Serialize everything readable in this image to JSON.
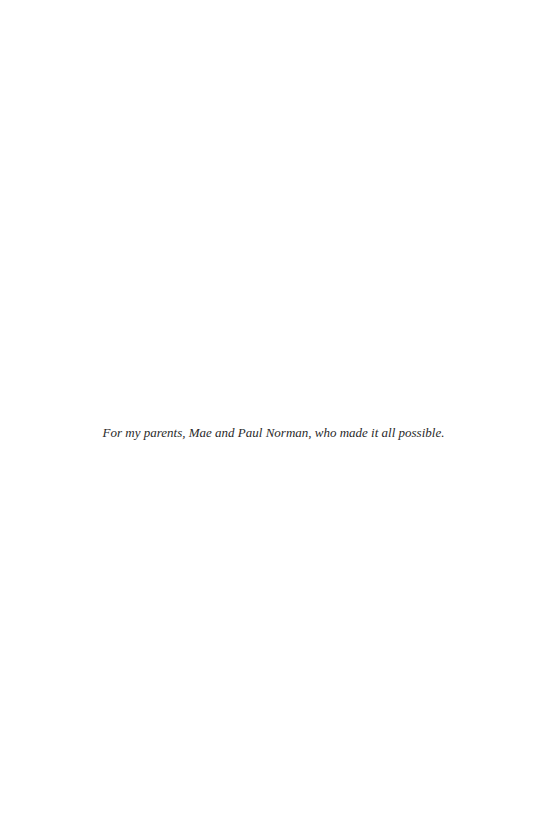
{
  "page": {
    "dedication": "For my parents, Mae and Paul Norman, who made it all possible."
  }
}
